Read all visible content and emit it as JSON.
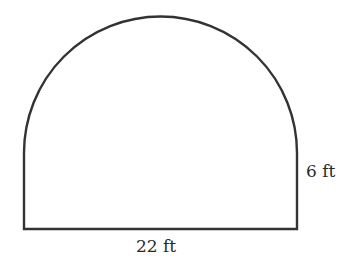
{
  "figure": {
    "shape": "rectangle-with-semicircle-top",
    "stroke_color": "#333333",
    "background": "#ffffff",
    "labels": {
      "width": "22 ft",
      "side_height": "6 ft"
    }
  }
}
